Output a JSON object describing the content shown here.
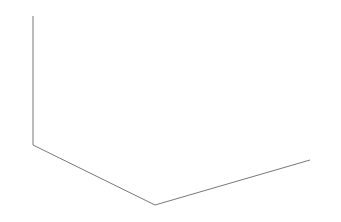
{
  "chart_data": {
    "type": "3d-surface",
    "title": "",
    "xlabel": "",
    "ylabel": "",
    "zlabel": "",
    "x_ticks": [
      "-10",
      "-5",
      "0",
      "5",
      "10"
    ],
    "y_ticks": [
      "10",
      "5",
      "0",
      "-5",
      "-10"
    ],
    "z_ticks": [
      "10",
      "5",
      "0",
      "-5",
      "-10"
    ],
    "xlim": [
      -10,
      10
    ],
    "ylim": [
      -10,
      10
    ],
    "zlim": [
      -10,
      10
    ],
    "grid": false,
    "legend": null,
    "ring": {
      "radius": 10,
      "segments": 40,
      "tube_width": 1
    }
  },
  "axes": {
    "z": {
      "ticks": [
        {
          "label": "10",
          "x": 33,
          "y": 16
        },
        {
          "label": "5",
          "x": 33,
          "y": 48
        },
        {
          "label": "0",
          "x": 33,
          "y": 80
        },
        {
          "label": "-5",
          "x": 33,
          "y": 113
        },
        {
          "label": "-10",
          "x": 33,
          "y": 145
        }
      ]
    },
    "y": {
      "ticks": [
        {
          "label": "10",
          "x": 33,
          "y": 145
        },
        {
          "label": "5",
          "x": 63,
          "y": 160
        },
        {
          "label": "0",
          "x": 94,
          "y": 175
        },
        {
          "label": "-5",
          "x": 124,
          "y": 190
        },
        {
          "label": "-10",
          "x": 155,
          "y": 205
        }
      ]
    },
    "x": {
      "ticks": [
        {
          "label": "-10",
          "x": 155,
          "y": 205
        },
        {
          "label": "-5",
          "x": 194,
          "y": 194
        },
        {
          "label": "0",
          "x": 233,
          "y": 182
        },
        {
          "label": "5",
          "x": 271,
          "y": 171
        },
        {
          "label": "10",
          "x": 310,
          "y": 160
        }
      ]
    }
  }
}
